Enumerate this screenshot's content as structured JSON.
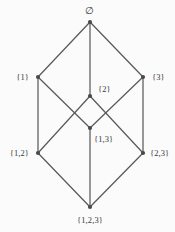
{
  "figure": {
    "background_color": "#fbfbfb",
    "edge_color": "#5a5a5a",
    "node_color": "#4a4a4a",
    "label_color": "#3a3a3a"
  },
  "chart_data": {
    "type": "diagram",
    "diagram_kind": "hasse-lattice",
    "xlabel": "",
    "ylabel": "",
    "grid": false,
    "legend": null,
    "xlim": [
      0,
      175
    ],
    "ylim": [
      0,
      232
    ],
    "nodes": [
      {
        "id": "empty",
        "label": "∅",
        "x": 90,
        "y": 22,
        "label_x": 90,
        "label_y": 11,
        "label_anchor": "center"
      },
      {
        "id": "s1",
        "label": "{1}",
        "x": 38,
        "y": 77,
        "label_x": 29,
        "label_y": 77,
        "label_anchor": "right"
      },
      {
        "id": "s2",
        "label": "{2}",
        "x": 90,
        "y": 96,
        "label_x": 98,
        "label_y": 89,
        "label_anchor": "left"
      },
      {
        "id": "s3",
        "label": "{3}",
        "x": 143,
        "y": 77,
        "label_x": 152,
        "label_y": 77,
        "label_anchor": "left"
      },
      {
        "id": "s12",
        "label": "{1,2}",
        "x": 38,
        "y": 153,
        "label_x": 29,
        "label_y": 153,
        "label_anchor": "right"
      },
      {
        "id": "s13",
        "label": "{1,3}",
        "x": 90,
        "y": 128,
        "label_x": 94,
        "label_y": 139,
        "label_anchor": "left"
      },
      {
        "id": "s23",
        "label": "{2,3}",
        "x": 143,
        "y": 153,
        "label_x": 150,
        "label_y": 153,
        "label_anchor": "left"
      },
      {
        "id": "s123",
        "label": "{1,2,3}",
        "x": 90,
        "y": 207,
        "label_x": 90,
        "label_y": 220,
        "label_anchor": "center"
      }
    ],
    "edges": [
      {
        "from": "empty",
        "to": "s1"
      },
      {
        "from": "empty",
        "to": "s2"
      },
      {
        "from": "empty",
        "to": "s3"
      },
      {
        "from": "s1",
        "to": "s12"
      },
      {
        "from": "s1",
        "to": "s13"
      },
      {
        "from": "s2",
        "to": "s12"
      },
      {
        "from": "s2",
        "to": "s23"
      },
      {
        "from": "s3",
        "to": "s13"
      },
      {
        "from": "s3",
        "to": "s23"
      },
      {
        "from": "s12",
        "to": "s123"
      },
      {
        "from": "s13",
        "to": "s123"
      },
      {
        "from": "s23",
        "to": "s123"
      }
    ]
  }
}
